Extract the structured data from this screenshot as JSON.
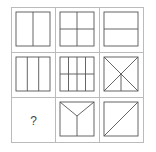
{
  "puzzle": {
    "description": "3x3 figure-reasoning grid of squares subdivided by lines; bottom-left cell is the missing figure",
    "cells": [
      {
        "row": 0,
        "col": 0,
        "figure": "square-one-vertical-line"
      },
      {
        "row": 0,
        "col": 1,
        "figure": "square-cross-vertical-and-horizontal"
      },
      {
        "row": 0,
        "col": 2,
        "figure": "square-one-horizontal-line"
      },
      {
        "row": 1,
        "col": 0,
        "figure": "square-two-vertical-lines"
      },
      {
        "row": 1,
        "col": 1,
        "figure": "square-three-vertical-one-horizontal"
      },
      {
        "row": 1,
        "col": 2,
        "figure": "square-two-diagonals-plus-lower-vertical"
      },
      {
        "row": 2,
        "col": 0,
        "figure": "missing",
        "label": "?"
      },
      {
        "row": 2,
        "col": 1,
        "figure": "square-y-shape"
      },
      {
        "row": 2,
        "col": 2,
        "figure": "square-one-diagonal"
      }
    ],
    "missing_label": "?",
    "line_color": "#555555",
    "grid_color": "#bbbbbb"
  }
}
